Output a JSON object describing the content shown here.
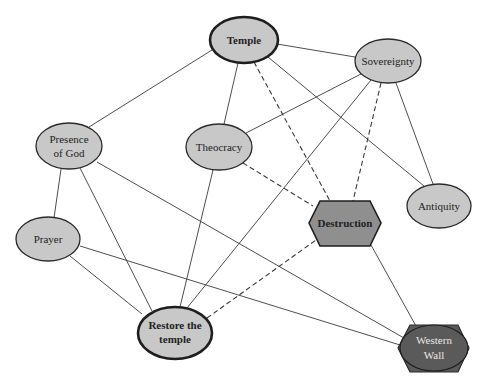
{
  "diagram": {
    "type": "concept-network",
    "colors": {
      "node_fill": "#c8c8c8",
      "node_stroke": "#2a2a2a",
      "destruction_fill": "#8f8f8f",
      "western_wall_fill": "#5a5a5a",
      "edge": "#3a3a3a"
    },
    "nodes": [
      {
        "id": "temple",
        "label": "Temple",
        "shape": "ellipse",
        "emphasis": "bold",
        "cx": 244,
        "cy": 40,
        "rx": 34,
        "ry": 23
      },
      {
        "id": "sovereignty",
        "label": "Sovereignty",
        "shape": "ellipse",
        "cx": 388,
        "cy": 61,
        "rx": 33,
        "ry": 22
      },
      {
        "id": "presence",
        "label_line1": "Presence",
        "label_line2": "of God",
        "shape": "ellipse",
        "cx": 69,
        "cy": 146,
        "rx": 33,
        "ry": 23
      },
      {
        "id": "theocracy",
        "label": "Theocracy",
        "shape": "ellipse",
        "cx": 219,
        "cy": 147,
        "rx": 33,
        "ry": 23
      },
      {
        "id": "destruction",
        "label": "Destruction",
        "shape": "hexagon",
        "emphasis": "bold",
        "cx": 345,
        "cy": 223
      },
      {
        "id": "antiquity",
        "label": "Antiquity",
        "shape": "ellipse",
        "cx": 439,
        "cy": 206,
        "rx": 32,
        "ry": 22
      },
      {
        "id": "prayer",
        "label": "Prayer",
        "shape": "ellipse",
        "cx": 48,
        "cy": 239,
        "rx": 32,
        "ry": 22
      },
      {
        "id": "restore",
        "label_line1": "Restore the",
        "label_line2": "temple",
        "shape": "ellipse",
        "emphasis": "bold",
        "cx": 175,
        "cy": 333,
        "rx": 37,
        "ry": 26
      },
      {
        "id": "western_wall",
        "label_line1": "Western",
        "label_line2": "Wall",
        "shape": "hexagon+ellipse",
        "cx": 434,
        "cy": 348
      }
    ],
    "edges": [
      {
        "from": "temple",
        "to": "presence",
        "style": "solid"
      },
      {
        "from": "temple",
        "to": "sovereignty",
        "style": "solid"
      },
      {
        "from": "temple",
        "to": "theocracy",
        "style": "solid"
      },
      {
        "from": "temple",
        "to": "destruction",
        "style": "dashed"
      },
      {
        "from": "temple",
        "to": "antiquity",
        "style": "solid"
      },
      {
        "from": "sovereignty",
        "to": "theocracy",
        "style": "solid"
      },
      {
        "from": "sovereignty",
        "to": "restore",
        "style": "solid"
      },
      {
        "from": "sovereignty",
        "to": "destruction",
        "style": "dashed"
      },
      {
        "from": "sovereignty",
        "to": "antiquity",
        "style": "solid"
      },
      {
        "from": "theocracy",
        "to": "destruction",
        "style": "dashed"
      },
      {
        "from": "theocracy",
        "to": "restore",
        "style": "solid"
      },
      {
        "from": "presence",
        "to": "prayer",
        "style": "solid"
      },
      {
        "from": "presence",
        "to": "restore",
        "style": "solid"
      },
      {
        "from": "presence",
        "to": "western_wall",
        "style": "solid"
      },
      {
        "from": "prayer",
        "to": "restore",
        "style": "solid"
      },
      {
        "from": "prayer",
        "to": "western_wall",
        "style": "solid"
      },
      {
        "from": "restore",
        "to": "destruction",
        "style": "dashed"
      },
      {
        "from": "destruction",
        "to": "western_wall",
        "style": "solid"
      }
    ]
  }
}
